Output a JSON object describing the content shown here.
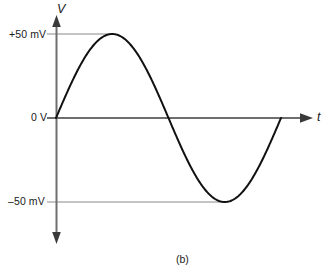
{
  "figure": {
    "caption": "(b)",
    "y_axis_name": "V",
    "x_axis_name": "t",
    "labels": {
      "plus_50": "+50 mV",
      "zero": "0 V",
      "minus_50": "–50 mV"
    },
    "colors": {
      "curve": "#111111",
      "axis": "#6e6e6e",
      "gridline": "#8a8a8a",
      "text": "#1a1a1a",
      "background": "#ffffff"
    }
  },
  "chart_data": {
    "type": "line",
    "title": "(b)",
    "xlabel": "t",
    "ylabel": "V",
    "grid": true,
    "legend": null,
    "ylim": [
      -50,
      50
    ],
    "ytick_labels": [
      "+50 mV",
      "0 V",
      "–50 mV"
    ],
    "ytick_values": [
      50,
      0,
      -50
    ],
    "xtick_labels": [],
    "series": [
      {
        "name": "sine voltage",
        "waveform": "sine",
        "amplitude_mV": 50,
        "cycles_shown": 1,
        "phase_deg": 0,
        "x": [
          0,
          0.0625,
          0.125,
          0.1875,
          0.25,
          0.3125,
          0.375,
          0.4375,
          0.5,
          0.5625,
          0.625,
          0.6875,
          0.75,
          0.8125,
          0.875,
          0.9375,
          1
        ],
        "values": [
          0,
          19.1,
          35.4,
          46.2,
          50,
          46.2,
          35.4,
          19.1,
          0,
          -19.1,
          -35.4,
          -46.2,
          -50,
          -46.2,
          -35.4,
          -19.1,
          0
        ]
      }
    ],
    "annotations": [
      {
        "text": "+50 mV",
        "type": "gridline",
        "y": 50
      },
      {
        "text": "0 V",
        "type": "axis",
        "y": 0
      },
      {
        "text": "–50 mV",
        "type": "gridline",
        "y": -50
      }
    ]
  }
}
